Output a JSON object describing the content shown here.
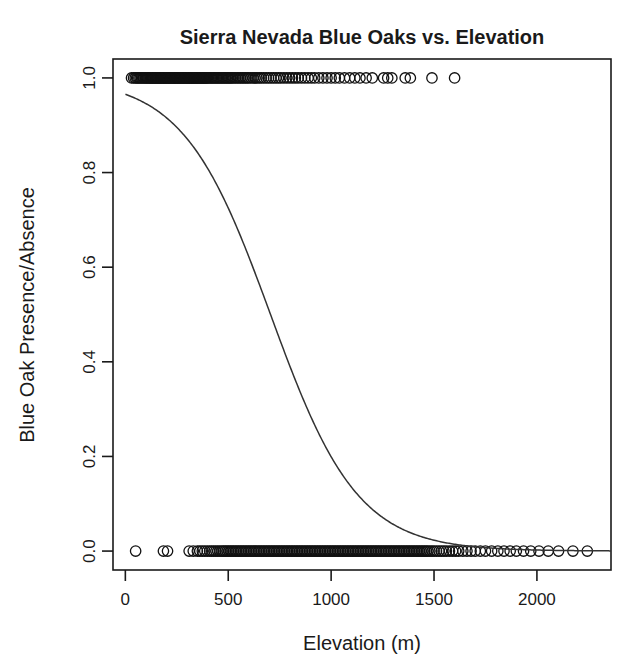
{
  "chart_data": {
    "type": "scatter",
    "title": "Sierra Nevada Blue Oaks vs. Elevation",
    "xlabel": "Elevation (m)",
    "ylabel": "Blue Oak Presence/Absence",
    "xlim": [
      -60,
      2360
    ],
    "ylim": [
      -0.04,
      1.04
    ],
    "grid": false,
    "legend": null,
    "xticks": [
      0,
      500,
      1000,
      1500,
      2000
    ],
    "xtick_labels": [
      "0",
      "500",
      "1000",
      "1500",
      "2000"
    ],
    "yticks": [
      0.0,
      0.2,
      0.4,
      0.6,
      0.8,
      1.0
    ],
    "ytick_labels": [
      "0.0",
      "0.2",
      "0.4",
      "0.6",
      "0.8",
      "1.0"
    ],
    "marker": "open-circle",
    "marker_color": "#111111",
    "curve_color": "#333333",
    "series": [
      {
        "name": "Presence (y = 1)",
        "y": 1,
        "x": [
          30,
          40,
          48,
          55,
          60,
          66,
          72,
          78,
          84,
          90,
          96,
          100,
          105,
          110,
          115,
          120,
          124,
          128,
          132,
          136,
          140,
          144,
          148,
          152,
          156,
          160,
          164,
          168,
          172,
          176,
          180,
          184,
          188,
          192,
          196,
          200,
          204,
          208,
          212,
          216,
          220,
          224,
          228,
          232,
          236,
          240,
          244,
          248,
          252,
          256,
          260,
          264,
          268,
          272,
          276,
          280,
          284,
          288,
          292,
          296,
          300,
          304,
          308,
          312,
          316,
          320,
          324,
          328,
          332,
          336,
          340,
          344,
          348,
          352,
          356,
          360,
          364,
          368,
          372,
          376,
          380,
          384,
          388,
          392,
          396,
          400,
          406,
          412,
          418,
          424,
          430,
          436,
          442,
          448,
          454,
          460,
          466,
          472,
          478,
          484,
          490,
          496,
          502,
          508,
          514,
          520,
          528,
          536,
          544,
          552,
          560,
          568,
          576,
          584,
          592,
          600,
          610,
          620,
          630,
          640,
          650,
          660,
          672,
          684,
          696,
          708,
          720,
          732,
          744,
          756,
          770,
          784,
          798,
          812,
          826,
          840,
          856,
          872,
          888,
          904,
          920,
          940,
          960,
          980,
          1000,
          1020,
          1040,
          1065,
          1090,
          1115,
          1140,
          1170,
          1200,
          1255,
          1275,
          1295,
          1360,
          1385,
          1490,
          1600
        ]
      },
      {
        "name": "Absence (y = 0)",
        "y": 0,
        "x": [
          50,
          185,
          205,
          310,
          330,
          350,
          362,
          374,
          386,
          398,
          410,
          420,
          430,
          440,
          450,
          460,
          470,
          478,
          486,
          494,
          502,
          510,
          518,
          526,
          534,
          542,
          550,
          558,
          566,
          574,
          582,
          590,
          598,
          606,
          614,
          622,
          630,
          638,
          646,
          654,
          662,
          670,
          678,
          686,
          694,
          702,
          710,
          718,
          726,
          734,
          742,
          750,
          758,
          766,
          774,
          782,
          790,
          798,
          806,
          814,
          822,
          830,
          838,
          846,
          854,
          862,
          870,
          878,
          886,
          894,
          902,
          910,
          918,
          926,
          934,
          942,
          950,
          958,
          966,
          974,
          982,
          990,
          998,
          1006,
          1014,
          1022,
          1030,
          1038,
          1046,
          1054,
          1062,
          1070,
          1078,
          1086,
          1094,
          1102,
          1110,
          1118,
          1126,
          1134,
          1142,
          1150,
          1158,
          1166,
          1174,
          1182,
          1190,
          1198,
          1206,
          1214,
          1222,
          1230,
          1238,
          1246,
          1254,
          1262,
          1270,
          1278,
          1286,
          1294,
          1302,
          1310,
          1318,
          1326,
          1334,
          1342,
          1350,
          1358,
          1366,
          1374,
          1382,
          1390,
          1398,
          1406,
          1414,
          1422,
          1430,
          1438,
          1446,
          1454,
          1462,
          1470,
          1480,
          1490,
          1500,
          1512,
          1524,
          1536,
          1548,
          1560,
          1575,
          1590,
          1605,
          1620,
          1640,
          1660,
          1680,
          1700,
          1725,
          1750,
          1780,
          1810,
          1840,
          1870,
          1900,
          1935,
          1970,
          2010,
          2055,
          2105,
          2175,
          2245
        ]
      }
    ],
    "fit": {
      "name": "Logistic regression fit",
      "model": "logistic",
      "intercept": 3.33,
      "slope": -0.00472,
      "midpoint_elevation": 705,
      "value_at_x0": 0.965,
      "points": [
        {
          "x": 0,
          "y": 0.965
        },
        {
          "x": 100,
          "y": 0.945
        },
        {
          "x": 200,
          "y": 0.915
        },
        {
          "x": 300,
          "y": 0.868
        },
        {
          "x": 400,
          "y": 0.8
        },
        {
          "x": 500,
          "y": 0.71
        },
        {
          "x": 600,
          "y": 0.61
        },
        {
          "x": 700,
          "y": 0.505
        },
        {
          "x": 800,
          "y": 0.4
        },
        {
          "x": 900,
          "y": 0.305
        },
        {
          "x": 1000,
          "y": 0.222
        },
        {
          "x": 1100,
          "y": 0.157
        },
        {
          "x": 1200,
          "y": 0.108
        },
        {
          "x": 1300,
          "y": 0.073
        },
        {
          "x": 1400,
          "y": 0.049
        },
        {
          "x": 1500,
          "y": 0.032
        },
        {
          "x": 1600,
          "y": 0.021
        },
        {
          "x": 1700,
          "y": 0.013
        },
        {
          "x": 1800,
          "y": 0.009
        },
        {
          "x": 1900,
          "y": 0.006
        },
        {
          "x": 2000,
          "y": 0.004
        },
        {
          "x": 2100,
          "y": 0.003
        },
        {
          "x": 2200,
          "y": 0.002
        },
        {
          "x": 2300,
          "y": 0.001
        }
      ]
    }
  }
}
